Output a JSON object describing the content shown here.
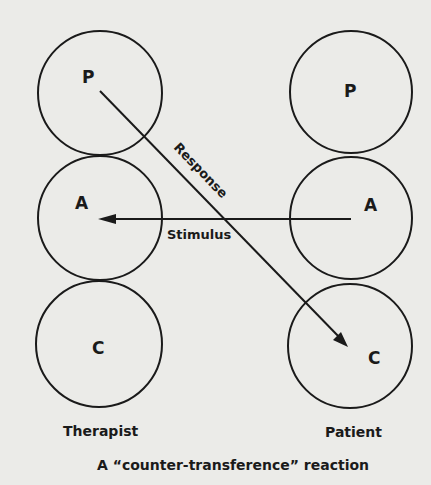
{
  "diagram": {
    "title": "A “counter-transference” reaction",
    "therapist": {
      "label": "Therapist",
      "states": [
        {
          "key": "P",
          "label": "P"
        },
        {
          "key": "A",
          "label": "A"
        },
        {
          "key": "C",
          "label": "C"
        }
      ]
    },
    "patient": {
      "label": "Patient",
      "states": [
        {
          "key": "P",
          "label": "P"
        },
        {
          "key": "A",
          "label": "A"
        },
        {
          "key": "C",
          "label": "C"
        }
      ]
    },
    "arrows": [
      {
        "name": "stimulus",
        "label": "Stimulus",
        "from": "Patient A",
        "to": "Therapist A"
      },
      {
        "name": "response",
        "label": "Response",
        "from": "Therapist P",
        "to": "Patient C"
      }
    ],
    "colors": {
      "background": "#ebebe8",
      "ink": "#1a1a1a"
    }
  }
}
